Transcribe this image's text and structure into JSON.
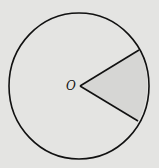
{
  "diagram": {
    "type": "circle-sector",
    "center_label": "O",
    "colors": {
      "background": "#e4e4e2",
      "stroke": "#111111",
      "sector_fill": "#d6d6d4"
    }
  }
}
